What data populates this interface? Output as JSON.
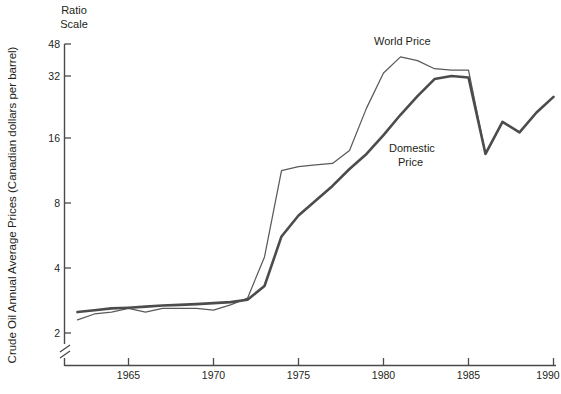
{
  "chart_data": {
    "type": "line",
    "title": "",
    "subtitle": "",
    "scale_note_line1": "Ratio",
    "scale_note_line2": "Scale",
    "ylabel": "Crude Oil Annual Average Prices (Canadian dollars per barrel)",
    "xlabel": "",
    "yscale": "log",
    "ylim": [
      1.8,
      52
    ],
    "xlim": [
      1962,
      1990
    ],
    "grid": false,
    "axis_break": true,
    "legend_position": "inline-annotations",
    "yticks": [
      2,
      4,
      8,
      16,
      32,
      48
    ],
    "ytick_labels": [
      "2",
      "4",
      "8",
      "16",
      "32",
      "48"
    ],
    "xticks": [
      1965,
      1970,
      1975,
      1980,
      1985,
      1990
    ],
    "xtick_labels": [
      "1965",
      "1970",
      "1975",
      "1980",
      "1985",
      "1990"
    ],
    "x": [
      1962,
      1963,
      1964,
      1965,
      1966,
      1967,
      1968,
      1969,
      1970,
      1971,
      1972,
      1973,
      1974,
      1975,
      1976,
      1977,
      1978,
      1979,
      1980,
      1981,
      1982,
      1983,
      1984,
      1985,
      1986,
      1987,
      1988,
      1989,
      1990
    ],
    "series": [
      {
        "name": "World Price",
        "style": "thin",
        "color": "#5a5a5a",
        "annotation": "World Price",
        "values": [
          2.3,
          2.45,
          2.5,
          2.6,
          2.5,
          2.6,
          2.6,
          2.6,
          2.55,
          2.7,
          2.9,
          4.5,
          11.3,
          11.8,
          12.0,
          12.2,
          14.0,
          22.0,
          32.0,
          38.0,
          36.5,
          33.5,
          33.0,
          33.0,
          13.5,
          19.0,
          17.0,
          21.0,
          24.8
        ]
      },
      {
        "name": "Domestic Price",
        "style": "thick",
        "color": "#4c4c4c",
        "annotation_line1": "Domestic",
        "annotation_line2": "Price",
        "values": [
          2.5,
          2.55,
          2.6,
          2.62,
          2.65,
          2.68,
          2.7,
          2.72,
          2.75,
          2.78,
          2.85,
          3.3,
          5.6,
          7.0,
          8.2,
          9.6,
          11.5,
          13.5,
          16.5,
          20.5,
          25.0,
          30.0,
          31.0,
          30.5,
          13.5,
          19.0,
          17.0,
          21.0,
          24.8
        ]
      }
    ],
    "annotations": [
      {
        "text": "World Price",
        "x": 1980.2,
        "y": 44,
        "name": "world-price-annotation"
      },
      {
        "text": "Domestic",
        "x": 1979.5,
        "y": 15.3,
        "name": "domestic-price-annotation-line1"
      },
      {
        "text": "Price",
        "x": 1979.9,
        "y": 13.2,
        "name": "domestic-price-annotation-line2"
      }
    ]
  }
}
